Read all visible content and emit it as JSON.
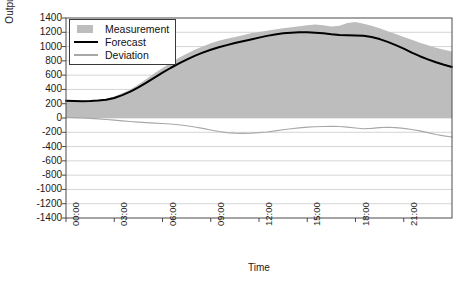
{
  "chart_data": {
    "type": "area",
    "title": "",
    "xlabel": "Time",
    "ylabel": "Output (MW)",
    "ylim": [
      -1400,
      1400
    ],
    "ytick_labels": [
      "1400",
      "1200",
      "1000",
      "800",
      "600",
      "400",
      "200",
      "0",
      "-200",
      "-400",
      "-600",
      "-800",
      "-1000",
      "-1200",
      "-1400"
    ],
    "ytick_values": [
      1400,
      1200,
      1000,
      800,
      600,
      400,
      200,
      0,
      -200,
      -400,
      -600,
      -800,
      -1000,
      -1200,
      -1400
    ],
    "xtick_labels": [
      "00:00",
      "03:00",
      "06:00",
      "09:00",
      "12:00",
      "15:00",
      "18:00",
      "21:00"
    ],
    "xtick_values": [
      0,
      3,
      6,
      9,
      12,
      15,
      18,
      21
    ],
    "xlim": [
      0,
      24
    ],
    "grid": true,
    "legend_position": "upper-left",
    "colors": {
      "measurement": "#bdbdbd",
      "forecast": "#000000",
      "deviation": "#a8a8a8",
      "grid": "#c9c9c9",
      "axis": "#4a4a4a",
      "text": "#1a1a1a"
    },
    "series": [
      {
        "name": "Measurement",
        "type": "area",
        "fill_base": 0,
        "x": [
          0,
          0.5,
          1,
          1.5,
          2,
          2.5,
          3,
          3.5,
          4,
          4.5,
          5,
          5.5,
          6,
          6.5,
          7,
          7.5,
          8,
          8.5,
          9,
          9.5,
          10,
          10.5,
          11,
          11.5,
          12,
          12.5,
          13,
          13.5,
          14,
          14.5,
          15,
          15.5,
          16,
          16.5,
          17,
          17.5,
          18,
          18.5,
          19,
          19.5,
          20,
          20.5,
          21,
          21.5,
          22,
          22.5,
          23,
          23.5,
          24
        ],
        "values": [
          250,
          248,
          245,
          248,
          255,
          270,
          300,
          345,
          400,
          470,
          545,
          625,
          700,
          770,
          840,
          900,
          955,
          1000,
          1045,
          1080,
          1110,
          1135,
          1160,
          1185,
          1205,
          1220,
          1240,
          1255,
          1270,
          1285,
          1300,
          1310,
          1300,
          1280,
          1290,
          1330,
          1345,
          1320,
          1290,
          1255,
          1215,
          1175,
          1135,
          1095,
          1055,
          1020,
          985,
          955,
          930
        ]
      },
      {
        "name": "Forecast",
        "type": "line",
        "x": [
          0,
          0.5,
          1,
          1.5,
          2,
          2.5,
          3,
          3.5,
          4,
          4.5,
          5,
          5.5,
          6,
          6.5,
          7,
          7.5,
          8,
          8.5,
          9,
          9.5,
          10,
          10.5,
          11,
          11.5,
          12,
          12.5,
          13,
          13.5,
          14,
          14.5,
          15,
          15.5,
          16,
          16.5,
          17,
          17.5,
          18,
          18.5,
          19,
          19.5,
          20,
          20.5,
          21,
          21.5,
          22,
          22.5,
          23,
          23.5,
          24
        ],
        "values": [
          240,
          238,
          236,
          238,
          244,
          255,
          280,
          320,
          370,
          430,
          495,
          565,
          635,
          700,
          760,
          818,
          870,
          915,
          955,
          990,
          1020,
          1050,
          1075,
          1100,
          1125,
          1150,
          1170,
          1185,
          1195,
          1200,
          1200,
          1195,
          1185,
          1172,
          1162,
          1158,
          1155,
          1150,
          1135,
          1105,
          1065,
          1020,
          970,
          915,
          865,
          820,
          780,
          745,
          715
        ]
      },
      {
        "name": "Deviation",
        "type": "line",
        "x": [
          0,
          0.5,
          1,
          1.5,
          2,
          2.5,
          3,
          3.5,
          4,
          4.5,
          5,
          5.5,
          6,
          6.5,
          7,
          7.5,
          8,
          8.5,
          9,
          9.5,
          10,
          10.5,
          11,
          11.5,
          12,
          12.5,
          13,
          13.5,
          14,
          14.5,
          15,
          15.5,
          16,
          16.5,
          17,
          17.5,
          18,
          18.5,
          19,
          19.5,
          20,
          20.5,
          21,
          21.5,
          22,
          22.5,
          23,
          23.5,
          24
        ],
        "values": [
          10,
          5,
          0,
          -5,
          -12,
          -20,
          -30,
          -40,
          -50,
          -58,
          -65,
          -72,
          -78,
          -85,
          -95,
          -108,
          -125,
          -145,
          -168,
          -190,
          -205,
          -212,
          -215,
          -212,
          -205,
          -195,
          -180,
          -165,
          -150,
          -138,
          -128,
          -122,
          -118,
          -115,
          -118,
          -128,
          -140,
          -150,
          -145,
          -135,
          -130,
          -135,
          -145,
          -160,
          -180,
          -205,
          -230,
          -250,
          -265
        ]
      }
    ]
  },
  "legend": {
    "items": [
      {
        "label": "Measurement",
        "key": "area"
      },
      {
        "label": "Forecast",
        "key": "line-dark"
      },
      {
        "label": "Deviation",
        "key": "line-light"
      }
    ]
  }
}
